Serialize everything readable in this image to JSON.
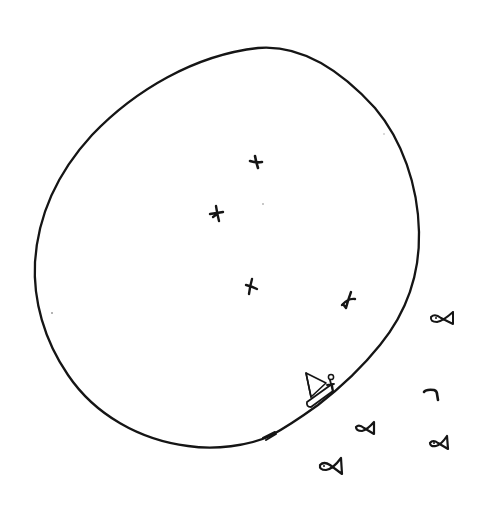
{
  "sketch": {
    "description": "Hand-drawn ink sketch of an island with birds, a sailboat at the shore, and fish in the surrounding water",
    "background_color": "#ffffff",
    "ink_color": "#151515",
    "island": {
      "label": "island-outline",
      "shape": "closed irregular loop"
    },
    "birds": [
      {
        "x": 256,
        "y": 162
      },
      {
        "x": 217,
        "y": 213
      },
      {
        "x": 251,
        "y": 286
      },
      {
        "x": 348,
        "y": 300
      }
    ],
    "boat": {
      "label": "sailboat",
      "x": 320,
      "y": 390,
      "has_person": true
    },
    "fish": [
      {
        "x": 443,
        "y": 318
      },
      {
        "x": 432,
        "y": 393
      },
      {
        "x": 365,
        "y": 428
      },
      {
        "x": 439,
        "y": 443
      },
      {
        "x": 330,
        "y": 466
      }
    ],
    "counts": {
      "birds": 4,
      "fish": 5,
      "boats": 1
    }
  }
}
